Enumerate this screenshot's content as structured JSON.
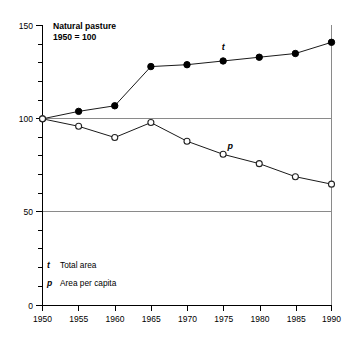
{
  "chart_data": {
    "type": "line",
    "title": "Natural pasture",
    "subtitle": "1950 = 100",
    "xlabel": "",
    "ylabel": "",
    "xlim": [
      1950,
      1990
    ],
    "ylim": [
      0,
      150
    ],
    "grid": true,
    "gridlines_y": [
      50,
      100
    ],
    "legend_position": "inside-lower-left",
    "x": [
      1950,
      1955,
      1960,
      1965,
      1970,
      1975,
      1980,
      1985,
      1990
    ],
    "xtick_labels": [
      "1950",
      "1955",
      "1960",
      "1965",
      "1970",
      "1975",
      "1980",
      "1985",
      "1990"
    ],
    "ytick_labels": [
      "0",
      "50",
      "100",
      "150"
    ],
    "ytick_values": [
      0,
      50,
      100,
      150
    ],
    "yminor_step": 10,
    "series": [
      {
        "name": "t",
        "legend_label": "Total area",
        "marker": "filled-circle",
        "plot_label": "t",
        "values": [
          100,
          104,
          107,
          128,
          129,
          131,
          133,
          135,
          141
        ]
      },
      {
        "name": "p",
        "legend_label": "Area per capita",
        "marker": "open-circle",
        "plot_label": "p",
        "values": [
          100,
          96,
          90,
          98,
          88,
          81,
          76,
          69,
          65
        ]
      }
    ],
    "annotations": [
      {
        "text": "t",
        "x": 1975,
        "y": 137
      },
      {
        "text": "p",
        "x": 1976,
        "y": 84
      }
    ],
    "colors": {
      "axis": "#000000",
      "grid": "#8a8a8a",
      "series_t": "#000000",
      "series_p": "#222222",
      "background": "#ffffff"
    }
  },
  "legend": {
    "entries": [
      {
        "key": "t",
        "label": "Total area"
      },
      {
        "key": "p",
        "label": "Area per capita"
      }
    ]
  }
}
